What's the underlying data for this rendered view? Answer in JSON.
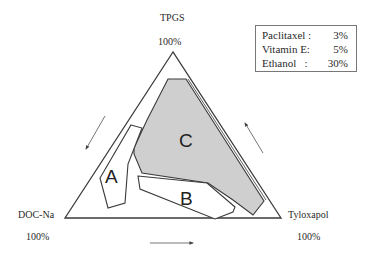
{
  "vertices": {
    "top": {
      "name": "TPGS",
      "percent": "100%"
    },
    "bottom_left": {
      "name": "DOC-Na",
      "percent": "100%"
    },
    "bottom_right": {
      "name": "Tyloxapol",
      "percent": "100%"
    }
  },
  "legend": {
    "rows": [
      {
        "name": "Paclitaxel :",
        "value": "3%"
      },
      {
        "name": "Vitamin E:",
        "value": "5%"
      },
      {
        "name": "Ethanol   :",
        "value": "30%"
      }
    ]
  },
  "regions": [
    {
      "id": "A",
      "label": "A",
      "fill": "#ffffff"
    },
    {
      "id": "B",
      "label": "B",
      "fill": "#ffffff"
    },
    {
      "id": "C",
      "label": "C",
      "fill": "#cfcfcf"
    }
  ],
  "colors": {
    "outline": "#3a3a3a",
    "region_c_fill": "#cfcfcf",
    "arrow": "#555555"
  },
  "arrows": [
    {
      "id": "left-edge-arrow",
      "direction": "down-left"
    },
    {
      "id": "right-edge-arrow",
      "direction": "up-left"
    },
    {
      "id": "bottom-edge-arrow",
      "direction": "right"
    }
  ]
}
